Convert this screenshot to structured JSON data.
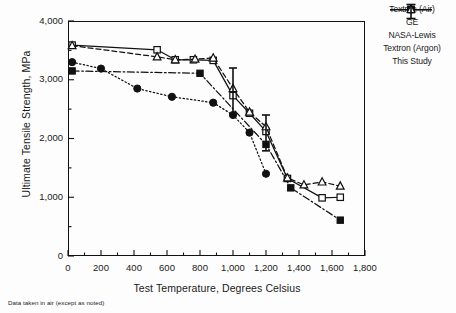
{
  "chart_data": {
    "type": "line",
    "title": "",
    "xlabel": "Test Temperature, Degrees Celsius",
    "ylabel": "Ultimate Tensile Strength, MPa",
    "xlim": [
      0,
      1800
    ],
    "ylim": [
      0,
      4000
    ],
    "xticks": [
      "0",
      "200",
      "400",
      "600",
      "800",
      "1,000",
      "1,200",
      "1,400",
      "1,600",
      "1,800"
    ],
    "xtick_values": [
      0,
      200,
      400,
      600,
      800,
      1000,
      1200,
      1400,
      1600,
      1800
    ],
    "yticks": [
      "0",
      "1,000",
      "2,000",
      "3,000",
      "4,000"
    ],
    "ytick_values": [
      0,
      1000,
      2000,
      3000,
      4000
    ],
    "x_minor_step": 100,
    "y_minor_step": 500,
    "grid": false,
    "legend_position": "right",
    "footnote": "Data taken in air (except as noted)",
    "series": [
      {
        "name": "Textron (Air)",
        "marker": "open-square",
        "linestyle": "solid",
        "points": [
          {
            "x": 25,
            "y": 3590
          },
          {
            "x": 540,
            "y": 3510
          },
          {
            "x": 650,
            "y": 3340
          },
          {
            "x": 760,
            "y": 3340
          },
          {
            "x": 880,
            "y": 3330
          },
          {
            "x": 1000,
            "y": 2730
          },
          {
            "x": 1100,
            "y": 2430
          },
          {
            "x": 1200,
            "y": 2120
          },
          {
            "x": 1330,
            "y": 1320
          },
          {
            "x": 1540,
            "y": 990
          },
          {
            "x": 1650,
            "y": 1000
          }
        ]
      },
      {
        "name": "GE",
        "marker": "filled-square",
        "linestyle": "dash-dot",
        "points": [
          {
            "x": 25,
            "y": 3150
          },
          {
            "x": 800,
            "y": 3110
          },
          {
            "x": 1200,
            "y": 1900
          },
          {
            "x": 1350,
            "y": 1160
          },
          {
            "x": 1650,
            "y": 610
          }
        ]
      },
      {
        "name": "NASA-Lewis",
        "marker": "filled-circle",
        "linestyle": "dotted",
        "points": [
          {
            "x": 25,
            "y": 3300
          },
          {
            "x": 200,
            "y": 3190
          },
          {
            "x": 420,
            "y": 2850
          },
          {
            "x": 630,
            "y": 2710
          },
          {
            "x": 880,
            "y": 2610
          },
          {
            "x": 1000,
            "y": 2400
          },
          {
            "x": 1100,
            "y": 2100
          },
          {
            "x": 1200,
            "y": 1400
          }
        ]
      },
      {
        "name": "Textron (Argon)",
        "marker": "open-triangle",
        "linestyle": "dashed",
        "points": [
          {
            "x": 25,
            "y": 3580
          },
          {
            "x": 540,
            "y": 3390
          },
          {
            "x": 650,
            "y": 3340
          },
          {
            "x": 770,
            "y": 3350
          },
          {
            "x": 880,
            "y": 3370
          },
          {
            "x": 1000,
            "y": 2850
          },
          {
            "x": 1100,
            "y": 2450
          },
          {
            "x": 1200,
            "y": 2200
          },
          {
            "x": 1330,
            "y": 1330
          },
          {
            "x": 1430,
            "y": 1210
          },
          {
            "x": 1540,
            "y": 1260
          },
          {
            "x": 1650,
            "y": 1190
          }
        ]
      },
      {
        "name": "This Study",
        "marker": "error-bar",
        "linestyle": "none",
        "error_bars": [
          {
            "x": 1000,
            "low": 2400,
            "high": 3200
          },
          {
            "x": 1200,
            "low": 1790,
            "high": 2400
          }
        ]
      }
    ]
  },
  "legend": {
    "items": [
      {
        "label": "Textron (Air)",
        "marker": "open-square",
        "linestyle": "solid"
      },
      {
        "label": "GE",
        "marker": "filled-square",
        "linestyle": "dash-dot"
      },
      {
        "label": "NASA-Lewis",
        "marker": "filled-circle",
        "linestyle": "dotted"
      },
      {
        "label": "Textron (Argon)",
        "marker": "open-triangle",
        "linestyle": "dashed"
      },
      {
        "label": "This Study",
        "marker": "error-bar",
        "linestyle": "none"
      }
    ]
  },
  "colors": {
    "ink": "#111111",
    "background": "#ffffff"
  }
}
